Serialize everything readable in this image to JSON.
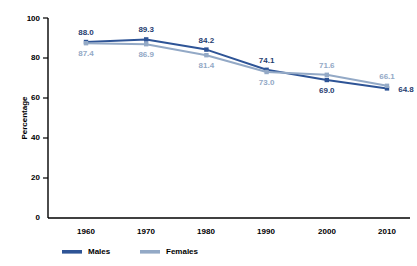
{
  "chart_data": {
    "type": "line",
    "title": "",
    "xlabel": "",
    "ylabel": "Percentage",
    "categories": [
      "1960",
      "1970",
      "1980",
      "1990",
      "2000",
      "2010"
    ],
    "x": [
      1960,
      1970,
      1980,
      1990,
      2000,
      2010
    ],
    "xlim": [
      1955,
      2015
    ],
    "ylim": [
      0,
      100
    ],
    "yticks": [
      0,
      20,
      40,
      60,
      80,
      100
    ],
    "ytick_labels": [
      "0",
      "20",
      "40",
      "60",
      "80",
      "100"
    ],
    "grid": false,
    "legend_position": "bottom-left",
    "series": [
      {
        "name": "Males",
        "color": "#2E5496",
        "label_color": "#1F3D70",
        "values": [
          88.0,
          89.3,
          84.2,
          74.1,
          69.0,
          64.8
        ],
        "value_labels": [
          "88.0",
          "89.3",
          "84.2",
          "74.1",
          "69.0",
          "64.8"
        ],
        "label_offsets": [
          "above",
          "above",
          "above",
          "above",
          "below",
          "right"
        ]
      },
      {
        "name": "Females",
        "color": "#93A9C6",
        "label_color": "#93A9C6",
        "values": [
          87.4,
          86.9,
          81.4,
          73.0,
          71.6,
          66.1
        ],
        "value_labels": [
          "87.4",
          "86.9",
          "81.4",
          "73.0",
          "71.6",
          "66.1"
        ],
        "label_offsets": [
          "below",
          "below",
          "below",
          "below",
          "above",
          "above"
        ]
      }
    ]
  },
  "legend": {
    "items": [
      {
        "label": "Males",
        "color": "#2E5496"
      },
      {
        "label": "Females",
        "color": "#93A9C6"
      }
    ]
  },
  "axes": {
    "y_title": "Percentage"
  }
}
